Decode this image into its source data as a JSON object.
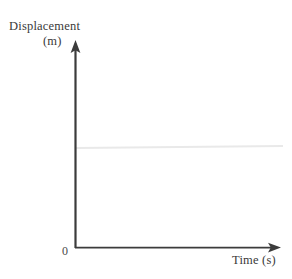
{
  "figure": {
    "background_color": "#ffffff",
    "width": 292,
    "height": 279,
    "origin_label": "0"
  },
  "axes": {
    "y": {
      "name": "Displacement",
      "unit": "(m)",
      "color": "#3c3c3c",
      "arrow": "up-arrow"
    },
    "x": {
      "name": "Time (s)",
      "color": "#3c3c3c",
      "arrow": "right-arrow"
    }
  },
  "chart_data": {
    "type": "line",
    "title": "",
    "xlabel": "Time (s)",
    "ylabel": "Displacement (m)",
    "grid": false,
    "legend": null,
    "axis_origin_label": "0",
    "xlim": [
      0,
      1
    ],
    "ylim": [
      0,
      1
    ],
    "xticks": [],
    "yticks": [],
    "series": [
      {
        "name": "displacement",
        "color": "#e9e9e9",
        "linewidth": 2,
        "x": [
          0,
          1
        ],
        "y": [
          0.5,
          0.51
        ],
        "description": "constant displacement over time (horizontal line)"
      }
    ]
  }
}
